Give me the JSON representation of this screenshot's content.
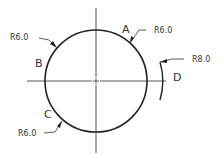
{
  "drawing": {
    "center": {
      "x": 96,
      "y": 81
    },
    "circle_radius_px": 51,
    "stroke_color": "#222222",
    "centerline_color": "#555555",
    "points": [
      {
        "id": "A",
        "label": "A"
      },
      {
        "id": "B",
        "label": "B"
      },
      {
        "id": "C",
        "label": "C"
      },
      {
        "id": "D",
        "label": "D"
      }
    ],
    "dimensions": [
      {
        "id": "dim-a",
        "text": "R6.0"
      },
      {
        "id": "dim-b",
        "text": "R6.0"
      },
      {
        "id": "dim-c",
        "text": "R6.0"
      },
      {
        "id": "dim-d",
        "text": "R8.0"
      }
    ]
  }
}
